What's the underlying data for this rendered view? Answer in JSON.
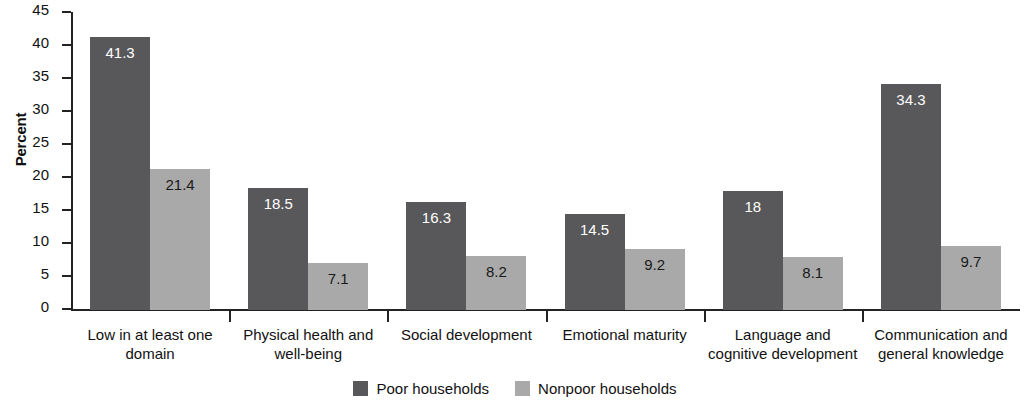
{
  "chart_data": {
    "type": "bar",
    "title": "",
    "subtitle": "",
    "xlabel": "",
    "ylabel": "Percent",
    "ylim": [
      0,
      45
    ],
    "ytick_step": 5,
    "yticks": [
      "45",
      "40",
      "35",
      "30",
      "25",
      "20",
      "15",
      "10",
      "5",
      "0"
    ],
    "grid": false,
    "legend_position": "bottom-center",
    "categories": [
      "Low in at least one domain",
      "Physical health and well-being",
      "Social development",
      "Emotional maturity",
      "Language and cognitive development",
      "Communication and general knowledge"
    ],
    "series": [
      {
        "name": "Poor households",
        "color": "#58585a",
        "values": [
          41.3,
          18.5,
          16.3,
          14.5,
          18,
          34.3
        ],
        "labels": [
          "41.3",
          "18.5",
          "16.3",
          "14.5",
          "18",
          "34.3"
        ]
      },
      {
        "name": "Nonpoor households",
        "color": "#a9a9a9",
        "values": [
          21.4,
          7.1,
          8.2,
          9.2,
          8.1,
          9.7
        ],
        "labels": [
          "21.4",
          "7.1",
          "8.2",
          "9.2",
          "8.1",
          "9.7"
        ]
      }
    ]
  },
  "colors": {
    "poor": "#58585a",
    "nonpoor": "#a9a9a9",
    "axis": "#222222",
    "text": "#111111",
    "background": "#ffffff"
  },
  "legend": {
    "items": [
      {
        "label": "Poor households",
        "color": "#58585a"
      },
      {
        "label": "Nonpoor households",
        "color": "#a9a9a9"
      }
    ]
  }
}
